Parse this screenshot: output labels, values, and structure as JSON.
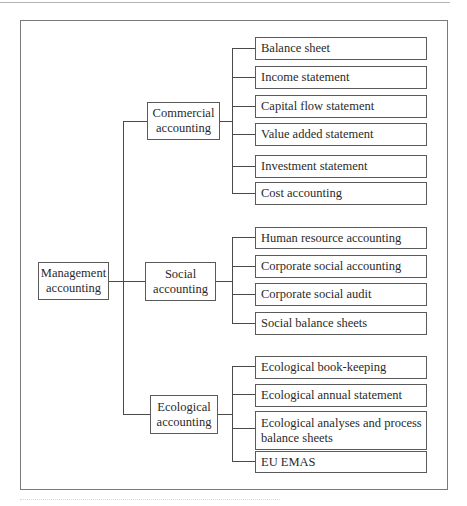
{
  "root": {
    "label": "Management accounting",
    "lines": [
      "Management",
      "accounting"
    ]
  },
  "branches": [
    {
      "label": "Commercial accounting",
      "lines": [
        "Commercial",
        "accounting"
      ],
      "children": [
        "Balance sheet",
        "Income statement",
        "Capital flow statement",
        "Value added statement",
        "Investment statement",
        "Cost accounting"
      ]
    },
    {
      "label": "Social accounting",
      "lines": [
        "Social",
        "accounting"
      ],
      "children": [
        "Human resource accounting",
        "Corporate social accounting",
        "Corporate social audit",
        "Social balance sheets"
      ]
    },
    {
      "label": "Ecological accounting",
      "lines": [
        "Ecological",
        "accounting"
      ],
      "children": [
        "Ecological book-keeping",
        "Ecological annual statement",
        "Ecological analyses and process balance sheets",
        "EU EMAS"
      ]
    }
  ],
  "colors": {
    "line": "#4a4a4a",
    "frame": "#7a7a7a",
    "text": "#2a2a2a"
  }
}
